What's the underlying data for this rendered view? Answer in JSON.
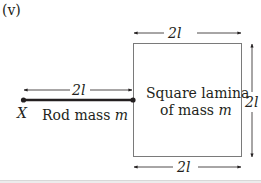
{
  "figure": {
    "part_label": "(v)",
    "rod": {
      "length_label": "2l",
      "end_point_label": "X",
      "caption_prefix": "Rod mass ",
      "caption_mass": "m"
    },
    "lamina": {
      "top_dimension": "2l",
      "right_dimension": "2l",
      "bottom_dimension": "2l",
      "caption_line1": "Square lamina",
      "caption_line2_prefix": "of mass ",
      "caption_line2_mass": "m"
    },
    "colors": {
      "ink": "#231f20",
      "square_outline": "#7a7a7a"
    }
  }
}
